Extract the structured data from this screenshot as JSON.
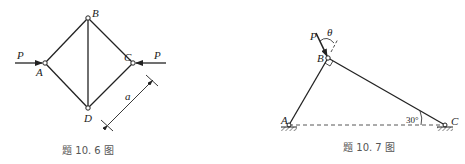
{
  "figures": [
    {
      "id": "fig-10-6",
      "caption": "题 10. 6 图",
      "nodes": {
        "A": "A",
        "B": "B",
        "C": "C",
        "D": "D"
      },
      "loads": {
        "left": "P",
        "right": "P"
      },
      "dimension": "a"
    },
    {
      "id": "fig-10-7",
      "caption": "题 10. 7 图",
      "nodes": {
        "A": "A",
        "B": "B",
        "C": "C"
      },
      "load": "P",
      "angle_theta": "θ",
      "angle_c": "30°"
    }
  ]
}
